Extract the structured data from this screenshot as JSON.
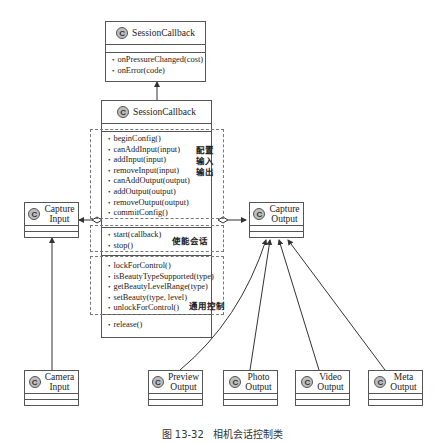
{
  "diagram": {
    "type": "UML class diagram",
    "class_icon_glyph": "C",
    "classes": {
      "callback_top": {
        "name": "SessionCallback",
        "methods": [
          "onPressureChanged(cost)",
          "onError(code)"
        ]
      },
      "session": {
        "name": "SessionCallback",
        "groups": {
          "config": {
            "methods": [
              "beginConfig()",
              "canAddInput(input)",
              "addInput(input)",
              "removeInput(input)",
              "canAddOutput(output)",
              "addOutput(output)",
              "removeOutput(output)",
              "commitConfig()"
            ],
            "note": "配置\n输入\n输出"
          },
          "enable": {
            "methods": [
              "start(callback)",
              "stop()"
            ],
            "note": "使能会话"
          },
          "control": {
            "methods": [
              "lockForControl()",
              "isBeautyTypeSupported(type)",
              "getBeautyLevelRange(type)",
              "setBeauty(type, level)",
              "unlockForControl()"
            ],
            "note": "通用控制"
          },
          "other": {
            "methods": [
              "release()"
            ]
          }
        }
      },
      "capture_input": {
        "name_line1": "Capture",
        "name_line2": "Input"
      },
      "capture_output": {
        "name_line1": "Capture",
        "name_line2": "Output"
      },
      "camera_input": {
        "name_line1": "Camera",
        "name_line2": "Input"
      },
      "preview_output": {
        "name_line1": "Preview",
        "name_line2": "Output"
      },
      "photo_output": {
        "name_line1": "Photo",
        "name_line2": "Output"
      },
      "video_output": {
        "name_line1": "Video",
        "name_line2": "Output"
      },
      "meta_output": {
        "name_line1": "Meta",
        "name_line2": "Output"
      }
    },
    "relations": [
      {
        "from": "session",
        "to": "callback_top",
        "kind": "association-arrow"
      },
      {
        "from": "session",
        "to": "capture_input",
        "kind": "aggregation"
      },
      {
        "from": "session",
        "to": "capture_output",
        "kind": "aggregation"
      },
      {
        "from": "camera_input",
        "to": "capture_input",
        "kind": "inheritance"
      },
      {
        "from": "preview_output",
        "to": "capture_output",
        "kind": "inheritance"
      },
      {
        "from": "photo_output",
        "to": "capture_output",
        "kind": "inheritance"
      },
      {
        "from": "video_output",
        "to": "capture_output",
        "kind": "inheritance"
      },
      {
        "from": "meta_output",
        "to": "capture_output",
        "kind": "inheritance"
      }
    ],
    "caption": "图 13-32   相机会话控制类"
  }
}
